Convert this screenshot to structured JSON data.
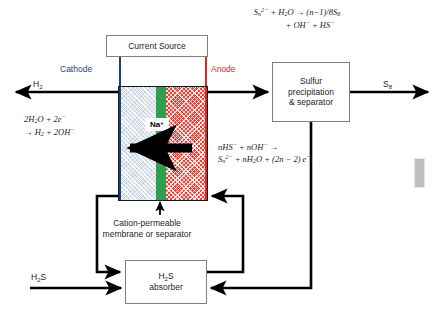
{
  "diagram": {
    "current_source": {
      "label": "Current Source"
    },
    "electrodes": {
      "cathode_label": "Cathode",
      "cathode_color": "#1f3f7a",
      "anode_label": "Anode",
      "anode_color": "#e8251c"
    },
    "cell": {
      "catholyte_color": "#dfe6ec",
      "membrane_color": "#2f9e4f",
      "anolyte_color": "#e8443a",
      "ion_label": "Na",
      "ion_charge": "+",
      "membrane_caption_line1": "Cation-permeable",
      "membrane_caption_line2": "membrane or separator"
    },
    "streams": {
      "hydrogen": "H",
      "hydrogen_sub": "2",
      "sulfur": "S",
      "sulfur_sub": "8",
      "h2s": "H",
      "h2s_sub": "2",
      "h2s_tail": "S"
    },
    "boxes": {
      "separator_line1": "Sulfur",
      "separator_line2": "precipitation",
      "separator_line3": "& separator",
      "absorber_line1_pre": "H",
      "absorber_line1_sub": "2",
      "absorber_line1_post": "S",
      "absorber_line2": "absorber"
    },
    "equations": {
      "polysulfide_hydrolysis": {
        "line1": "S<sub>n</sub><sup>2−</sup> + H<sub>2</sub>O → (n−1)/8S<sub>8</sub>",
        "line2": "+ OH<sup>−</sup> + HS<sup>−</sup>",
        "plain": "Sn2- + H2O -> (n-1)/8 S8 + OH- + HS-"
      },
      "cathode_reaction": {
        "line1": "2H<sub>2</sub>O + 2e<sup>−</sup>",
        "line2": "→ H<sub>2</sub> + 2OH<sup>−</sup>",
        "plain": "2H2O + 2e- -> H2 + 2OH-"
      },
      "anode_reaction": {
        "line1": "nHS<sup>−</sup> + nOH<sup>−</sup> →",
        "line2": "S<sub>n</sub><sup>2−</sup> + nH<sub>2</sub>O + (2n − 2) e<sup>−</sup>",
        "plain": "nHS- + nOH- -> Sn2- + nH2O + (2n-2) e-"
      }
    }
  }
}
